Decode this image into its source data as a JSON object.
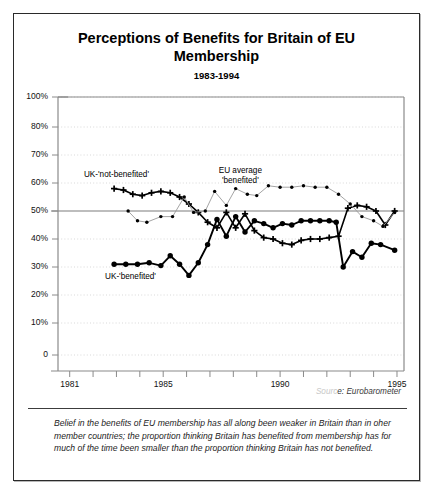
{
  "figure": {
    "title": "Perceptions of Benefits for Britain of EU Membership",
    "subtitle": "1983-1994",
    "source_prefix": "Sourc",
    "source_text": "e: Eurobarometer",
    "caption": "Belief in the benefits of EU membership has all along been weaker in Britain than in oher member countries; the proportion thinking Britain has benefited from membership has for much of the time been smaller than the proportion thinking Britain has not benefited."
  },
  "chart_data": {
    "type": "line",
    "title": "Perceptions of Benefits for Britain of EU Membership",
    "subtitle": "1983-1994",
    "xlabel": "",
    "ylabel": "",
    "xlim": [
      1980.5,
      1995.3
    ],
    "ylim": [
      0,
      100
    ],
    "grid": true,
    "reference_line": 50,
    "ytick_values": [
      0,
      10,
      20,
      30,
      40,
      50,
      60,
      70,
      80,
      100
    ],
    "ytick_labels": [
      "0",
      "10%",
      "20%",
      "30%",
      "40%",
      "50%",
      "60%",
      "70%",
      "80%",
      "100%"
    ],
    "xtick_values": [
      1981,
      1982,
      1983,
      1984,
      1985,
      1986,
      1987,
      1988,
      1989,
      1990,
      1991,
      1992,
      1993,
      1994,
      1995
    ],
    "xtick_labels": [
      {
        "value": 1981,
        "label": "1981"
      },
      {
        "value": 1985,
        "label": "1985"
      },
      {
        "value": 1990,
        "label": "1990"
      },
      {
        "value": 1995,
        "label": "1995"
      }
    ],
    "series": [
      {
        "name": "UK-'not-benefited'",
        "marker": "plus",
        "line_color": "#000000",
        "line_width": 1.6,
        "label_x": 1983.0,
        "label_y": 62.5,
        "points": [
          {
            "x": 1982.9,
            "y": 58.0
          },
          {
            "x": 1983.3,
            "y": 57.5
          },
          {
            "x": 1983.7,
            "y": 56.0
          },
          {
            "x": 1984.1,
            "y": 55.5
          },
          {
            "x": 1984.5,
            "y": 56.5
          },
          {
            "x": 1984.9,
            "y": 57.0
          },
          {
            "x": 1985.3,
            "y": 56.5
          },
          {
            "x": 1985.7,
            "y": 55.0
          },
          {
            "x": 1986.1,
            "y": 52.5
          },
          {
            "x": 1986.5,
            "y": 49.5
          },
          {
            "x": 1986.9,
            "y": 46.0
          },
          {
            "x": 1987.3,
            "y": 44.0
          },
          {
            "x": 1987.7,
            "y": 49.5
          },
          {
            "x": 1988.1,
            "y": 44.0
          },
          {
            "x": 1988.5,
            "y": 49.0
          },
          {
            "x": 1988.9,
            "y": 43.0
          },
          {
            "x": 1989.3,
            "y": 40.5
          },
          {
            "x": 1989.7,
            "y": 40.0
          },
          {
            "x": 1990.1,
            "y": 38.5
          },
          {
            "x": 1990.5,
            "y": 38.0
          },
          {
            "x": 1990.9,
            "y": 39.5
          },
          {
            "x": 1991.3,
            "y": 40.0
          },
          {
            "x": 1991.7,
            "y": 40.0
          },
          {
            "x": 1992.1,
            "y": 40.5
          },
          {
            "x": 1992.5,
            "y": 41.0
          },
          {
            "x": 1992.9,
            "y": 51.0
          },
          {
            "x": 1993.3,
            "y": 52.0
          },
          {
            "x": 1993.7,
            "y": 51.5
          },
          {
            "x": 1994.1,
            "y": 50.0
          },
          {
            "x": 1994.5,
            "y": 45.0
          },
          {
            "x": 1994.9,
            "y": 50.0
          }
        ]
      },
      {
        "name": "EU average 'benefited'",
        "marker": "dot-small",
        "line_color": "#9a9a9a",
        "line_width": 0.9,
        "label_x": 1988.3,
        "label_y": 64.0,
        "label_line_1": "EU average",
        "label_line_2": "'benefited'",
        "points": [
          {
            "x": 1983.5,
            "y": 50.0
          },
          {
            "x": 1983.9,
            "y": 46.5
          },
          {
            "x": 1984.3,
            "y": 46.0
          },
          {
            "x": 1984.9,
            "y": 48.0
          },
          {
            "x": 1985.4,
            "y": 48.0
          },
          {
            "x": 1985.9,
            "y": 55.0
          },
          {
            "x": 1986.3,
            "y": 49.5
          },
          {
            "x": 1986.8,
            "y": 50.0
          },
          {
            "x": 1987.2,
            "y": 57.0
          },
          {
            "x": 1987.7,
            "y": 52.0
          },
          {
            "x": 1988.1,
            "y": 58.0
          },
          {
            "x": 1988.6,
            "y": 56.0
          },
          {
            "x": 1989.0,
            "y": 55.5
          },
          {
            "x": 1989.5,
            "y": 59.0
          },
          {
            "x": 1990.0,
            "y": 58.5
          },
          {
            "x": 1990.5,
            "y": 58.5
          },
          {
            "x": 1991.0,
            "y": 59.0
          },
          {
            "x": 1991.5,
            "y": 58.5
          },
          {
            "x": 1992.0,
            "y": 58.5
          },
          {
            "x": 1992.5,
            "y": 56.0
          },
          {
            "x": 1993.0,
            "y": 52.5
          },
          {
            "x": 1993.5,
            "y": 48.0
          },
          {
            "x": 1994.0,
            "y": 46.5
          },
          {
            "x": 1994.4,
            "y": 44.5
          },
          {
            "x": 1994.9,
            "y": 49.5
          }
        ]
      },
      {
        "name": "UK-'benefited'",
        "marker": "dot-large",
        "line_color": "#000000",
        "line_width": 1.9,
        "label_x": 1983.6,
        "label_y": 26.0,
        "points": [
          {
            "x": 1982.9,
            "y": 31.0
          },
          {
            "x": 1983.4,
            "y": 31.0
          },
          {
            "x": 1983.9,
            "y": 31.0
          },
          {
            "x": 1984.4,
            "y": 31.5
          },
          {
            "x": 1984.9,
            "y": 30.5
          },
          {
            "x": 1985.3,
            "y": 34.0
          },
          {
            "x": 1985.7,
            "y": 31.0
          },
          {
            "x": 1986.1,
            "y": 27.0
          },
          {
            "x": 1986.5,
            "y": 31.5
          },
          {
            "x": 1986.9,
            "y": 38.0
          },
          {
            "x": 1987.3,
            "y": 47.0
          },
          {
            "x": 1987.7,
            "y": 41.0
          },
          {
            "x": 1988.1,
            "y": 48.0
          },
          {
            "x": 1988.5,
            "y": 42.5
          },
          {
            "x": 1988.9,
            "y": 46.5
          },
          {
            "x": 1989.3,
            "y": 45.5
          },
          {
            "x": 1989.7,
            "y": 44.0
          },
          {
            "x": 1990.1,
            "y": 45.5
          },
          {
            "x": 1990.5,
            "y": 45.0
          },
          {
            "x": 1990.9,
            "y": 46.5
          },
          {
            "x": 1991.3,
            "y": 46.5
          },
          {
            "x": 1991.7,
            "y": 46.5
          },
          {
            "x": 1992.1,
            "y": 46.5
          },
          {
            "x": 1992.4,
            "y": 46.0
          },
          {
            "x": 1992.7,
            "y": 30.0
          },
          {
            "x": 1993.1,
            "y": 35.5
          },
          {
            "x": 1993.5,
            "y": 33.5
          },
          {
            "x": 1993.9,
            "y": 38.5
          },
          {
            "x": 1994.3,
            "y": 38.0
          },
          {
            "x": 1994.9,
            "y": 36.0
          }
        ]
      }
    ]
  }
}
